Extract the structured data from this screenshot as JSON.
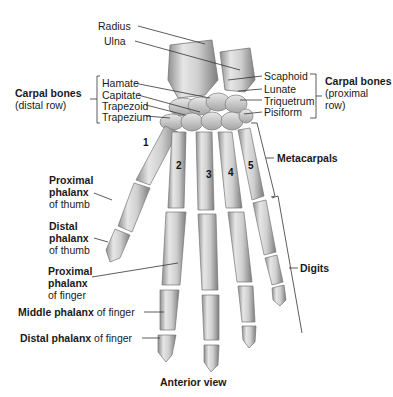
{
  "figure": {
    "caption": "Anterior view",
    "top_labels": {
      "radius": "Radius",
      "ulna": "Ulna"
    },
    "carpal_distal": {
      "group_title": "Carpal bones",
      "group_subtitle": "(distal row)",
      "items": [
        "Hamate",
        "Capitate",
        "Trapezoid",
        "Trapezium"
      ]
    },
    "carpal_proximal": {
      "group_title": "Carpal bones",
      "group_subtitle_line1": "(proximal",
      "group_subtitle_line2": "row)",
      "items": [
        "Scaphoid",
        "Lunate",
        "Triquetrum",
        "Pisiform"
      ]
    },
    "metacarpals": "Metacarpals",
    "digits": "Digits",
    "metacarpal_numbers": [
      "1",
      "2",
      "3",
      "4",
      "5"
    ],
    "left_labels": {
      "proximal_thumb": {
        "bold1": "Proximal",
        "bold2": "phalanx",
        "normal": "of thumb"
      },
      "distal_thumb": {
        "bold1": "Distal",
        "bold2": "phalanx",
        "normal": "of thumb"
      },
      "proximal_finger": {
        "bold1": "Proximal",
        "bold2": "phalanx",
        "normal": "of finger"
      },
      "middle_finger": {
        "bold": "Middle phalanx",
        "normal": " of finger"
      },
      "distal_finger": {
        "bold": "Distal phalanx",
        "normal": " of finger"
      }
    },
    "colors": {
      "bone_fill": "#d9d9d9",
      "bone_shadow": "#9a9a9a",
      "leader_line": "#333333",
      "text": "#1a1a1a"
    }
  }
}
